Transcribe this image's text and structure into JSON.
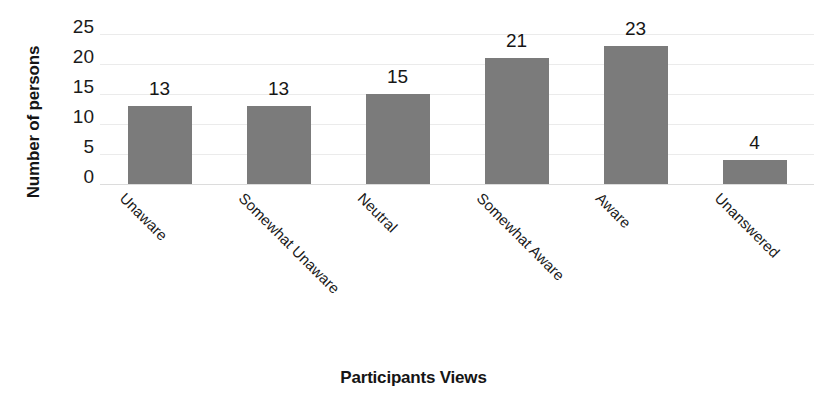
{
  "chart_data": {
    "type": "bar",
    "title": "",
    "xlabel": "Participants Views",
    "ylabel": "Number of persons",
    "categories": [
      "Unaware",
      "Somewhat Unaware",
      "Neutral",
      "Somewhat Aware",
      "Aware",
      "Unanswered"
    ],
    "values": [
      13,
      13,
      15,
      21,
      23,
      4
    ],
    "value_labels": [
      "13",
      "13",
      "15",
      "21",
      "23",
      "4"
    ],
    "ylim": [
      0,
      25
    ],
    "yticks": [
      0,
      5,
      10,
      15,
      20,
      25
    ],
    "ytick_labels": [
      "0",
      "5",
      "10",
      "15",
      "20",
      "25"
    ],
    "grid": true,
    "grid_axis": "y",
    "legend": false,
    "legend_position": "none",
    "bar_color": "#7b7b7b",
    "gridline_color": "#ebebeb",
    "text_color": "#161616",
    "xtick_rotation_deg": 45,
    "series": [
      {
        "name": "Number of persons",
        "values": [
          13,
          13,
          15,
          21,
          23,
          4
        ]
      }
    ]
  }
}
